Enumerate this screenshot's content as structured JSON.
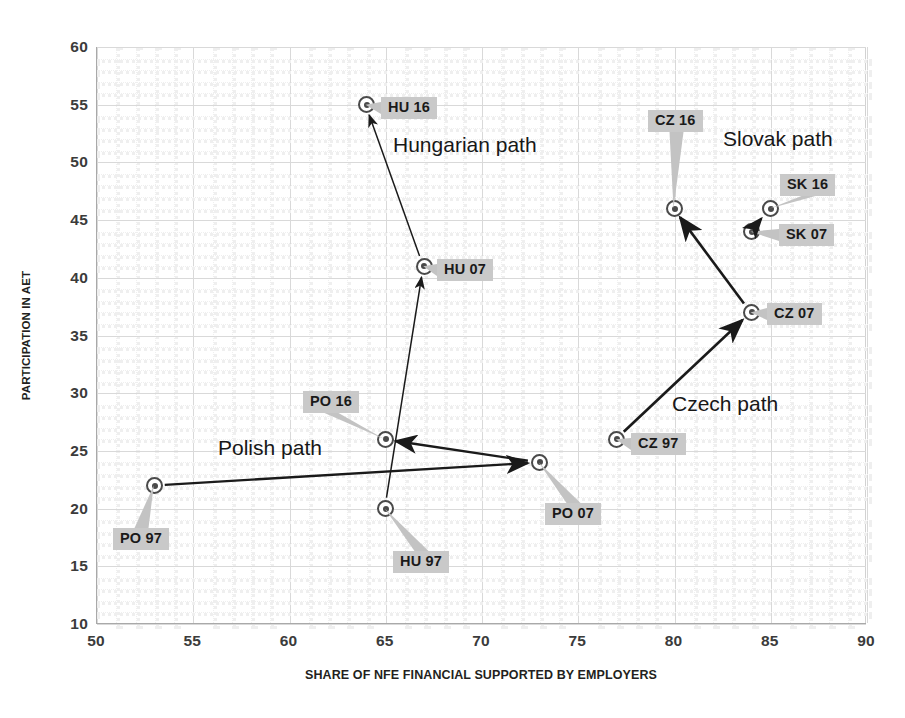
{
  "chart_data": {
    "type": "scatter",
    "title": "",
    "xlabel": "SHARE OF NFE FINANCIAL SUPPORTED BY EMPLOYERS",
    "ylabel": "PARTICIPATION IN AET",
    "xlim": [
      50,
      90
    ],
    "ylim": [
      10,
      60
    ],
    "xticks": [
      50,
      55,
      60,
      65,
      70,
      75,
      80,
      85,
      90
    ],
    "yticks": [
      60,
      55,
      50,
      45,
      40,
      35,
      30,
      25,
      20,
      15,
      10
    ],
    "grid": true,
    "legend": "none",
    "points": [
      {
        "label": "PO 97",
        "x": 53,
        "y": 22
      },
      {
        "label": "PO 07",
        "x": 73,
        "y": 24
      },
      {
        "label": "PO 16",
        "x": 65,
        "y": 26
      },
      {
        "label": "HU 97",
        "x": 65,
        "y": 20
      },
      {
        "label": "HU 07",
        "x": 67,
        "y": 41
      },
      {
        "label": "HU 16",
        "x": 64,
        "y": 55
      },
      {
        "label": "CZ 97",
        "x": 77,
        "y": 26
      },
      {
        "label": "CZ 07",
        "x": 84,
        "y": 37
      },
      {
        "label": "CZ 16",
        "x": 80,
        "y": 46
      },
      {
        "label": "SK 07",
        "x": 84,
        "y": 44
      },
      {
        "label": "SK 16",
        "x": 85,
        "y": 46
      }
    ],
    "annotations": [
      {
        "text": "Hungarian path",
        "x": 66.5,
        "y": 51.5
      },
      {
        "text": "Slovak path",
        "x": 81.5,
        "y": 52.5
      },
      {
        "text": "Czech path",
        "x": 79.0,
        "y": 28.5
      },
      {
        "text": "Polish path",
        "x": 60.0,
        "y": 24.3
      }
    ],
    "paths": [
      {
        "name": "Polish path",
        "sequence": [
          "PO 97",
          "PO 07",
          "PO 16"
        ]
      },
      {
        "name": "Hungarian path",
        "sequence": [
          "HU 97",
          "HU 07",
          "HU 16"
        ]
      },
      {
        "name": "Czech path",
        "sequence": [
          "CZ 97",
          "CZ 07",
          "CZ 16"
        ]
      },
      {
        "name": "Slovak path",
        "sequence": [
          "SK 07",
          "SK 16"
        ]
      }
    ],
    "colors": {
      "marker_stroke": "#4a4a4a",
      "label_background": "#c9c9c9",
      "arrow": "#1a1a1a",
      "grid": "#d9d9d9",
      "axis": "#a9a9a9"
    }
  }
}
